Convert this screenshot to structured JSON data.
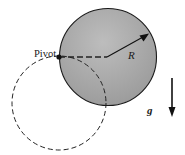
{
  "diagram": {
    "type": "physical-pendulum",
    "labels": {
      "pivot": "Pivot",
      "radius": "R",
      "gravity": "g"
    },
    "colors": {
      "disk_fill": "#a9a9a9",
      "stroke": "#1a1a1a",
      "background": "#ffffff"
    },
    "elements": [
      {
        "name": "solid-disk",
        "shape": "circle",
        "center": [
          108,
          57
        ],
        "radius": 48,
        "style": "solid, gray fill"
      },
      {
        "name": "dashed-circle",
        "shape": "circle",
        "center": [
          59,
          103
        ],
        "radius": 47,
        "style": "dashed, no fill"
      },
      {
        "name": "pivot-point",
        "shape": "dot",
        "position": [
          59,
          57
        ]
      },
      {
        "name": "pivot-to-center-line",
        "style": "dashed",
        "from": [
          59,
          57
        ],
        "to": [
          108,
          57
        ]
      },
      {
        "name": "radius-arrow",
        "style": "solid arrow",
        "from": [
          108,
          57
        ],
        "to": [
          148,
          34
        ],
        "label": "R"
      },
      {
        "name": "gravity-arrow",
        "style": "solid arrow pointing down",
        "from": [
          172,
          78
        ],
        "to": [
          172,
          115
        ],
        "label": "g"
      }
    ]
  }
}
